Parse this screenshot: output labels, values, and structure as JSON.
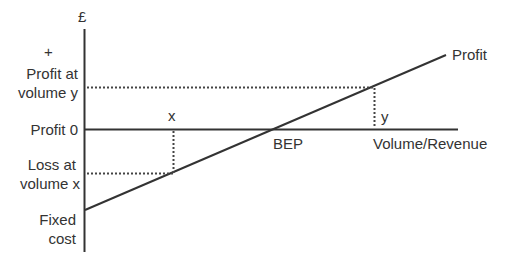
{
  "diagram": {
    "type": "profit-volume chart",
    "y_axis": {
      "unit_label": "£",
      "plus_label": "+"
    },
    "x_axis": {
      "label": "Volume/Revenue"
    },
    "left_labels": {
      "profit_at_y_line1": "Profit at",
      "profit_at_y_line2": "volume y",
      "profit_zero": "Profit 0",
      "loss_at_x_line1": "Loss at",
      "loss_at_x_line2": "volume x",
      "fixed_cost_line1": "Fixed",
      "fixed_cost_line2": "cost"
    },
    "point_labels": {
      "x": "x",
      "y": "y",
      "bep": "BEP",
      "profit_line": "Profit"
    },
    "colors": {
      "line": "#333333",
      "background": "#ffffff"
    }
  }
}
